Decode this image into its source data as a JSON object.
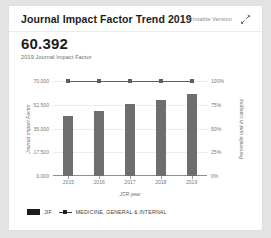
{
  "card": {
    "title": "Journal Impact Factor Trend 2019",
    "printable_label": "Printable Version",
    "expand_icon": "expand-diagonal-icon"
  },
  "kpi": {
    "value": "60.392",
    "caption": "2019 Journal Impact Factor"
  },
  "chart_data": {
    "type": "bar",
    "title": "Journal Impact Factor Trend 2019",
    "categories": [
      "2015",
      "2016",
      "2017",
      "2018",
      "2019"
    ],
    "xlabel": "JCR year",
    "ylabel": "Journal Impact Factor",
    "y2label": "Percentile rank in category",
    "ylim": [
      0,
      70
    ],
    "y2lim": [
      0,
      100
    ],
    "yticks": [
      "0.000",
      "17.500",
      "35.000",
      "52.500",
      "70.000"
    ],
    "y2ticks": [
      "0%",
      "25%",
      "50%",
      "75%",
      "100%"
    ],
    "grid": true,
    "legend_position": "bottom-left",
    "series": [
      {
        "name": "JIF",
        "type": "bar",
        "axis": "left",
        "color": "#6e6e6e",
        "values": [
          44.405,
          47.661,
          53.254,
          56.272,
          60.392
        ]
      },
      {
        "name": "MEDICINE, GENERAL & INTERNAL",
        "type": "line",
        "axis": "right",
        "color": "#5e5e5e",
        "values": [
          100,
          100,
          100,
          100,
          100
        ]
      }
    ]
  },
  "legend": {
    "items": [
      {
        "label": "JIF",
        "marker": "bar-swatch"
      },
      {
        "label": "MEDICINE, GENERAL & INTERNAL",
        "marker": "line-swatch"
      }
    ]
  }
}
